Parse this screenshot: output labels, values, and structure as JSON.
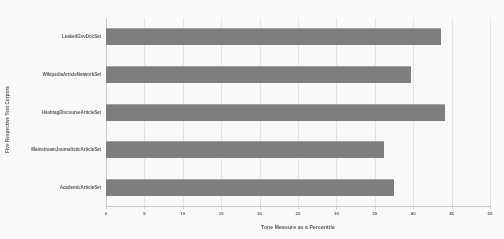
{
  "chart_data": {
    "type": "bar",
    "orientation": "horizontal",
    "title": "",
    "xlabel": "Tone Measure as a Percentile",
    "ylabel": "Five Respective Text Corpora",
    "categories": [
      "AcademicArticleSet",
      "MainstreamJournalisticArticleSet",
      "HashtagDiscourseArticleSet",
      "WikipediaArticleNetworkSet",
      "LeakedGovDocSet"
    ],
    "values": [
      37.5,
      36.2,
      44.2,
      39.7,
      43.6
    ],
    "xlim": [
      0,
      50
    ],
    "xticks": [
      0,
      5,
      10,
      15,
      20,
      25,
      30,
      35,
      40,
      45,
      50
    ],
    "xtick_labels": [
      "0",
      "5",
      "10",
      "15",
      "20",
      "25",
      "30",
      "35",
      "40",
      "45",
      "50"
    ],
    "grid": true,
    "grid_axis": "x",
    "legend": false,
    "bar_color": "#7b7b7b",
    "background_color": "#ffffff",
    "gridline_color": "#e9e9e9",
    "text_color": "#55555a"
  }
}
